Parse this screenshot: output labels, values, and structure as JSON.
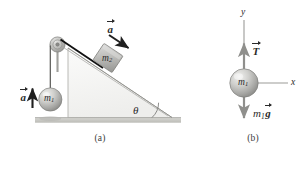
{
  "figure": {
    "panels": [
      {
        "id": "a",
        "caption": "(a)",
        "description": "Hanging mass m1 connected over a pulley to block m2 on a frictionless inclined plane",
        "labels": {
          "accel_hanging": "a",
          "accel_block": "a",
          "mass_hanging": "m",
          "mass_hanging_sub": "1",
          "mass_block": "m",
          "mass_block_sub": "2",
          "angle": "θ"
        }
      },
      {
        "id": "b",
        "caption": "(b)",
        "description": "Free-body diagram of the hanging mass m1 showing tension T upward and weight m1g downward",
        "labels": {
          "axis_y": "y",
          "axis_x": "x",
          "tension": "T",
          "mass": "m",
          "mass_sub": "1",
          "weight_mass": "m",
          "weight_sub": "1",
          "weight_g": "g"
        }
      }
    ]
  },
  "colors": {
    "ink": "#2a2a2a",
    "caption": "#3b3b3b",
    "incline_fill": "#f2f2f0",
    "incline_edge": "#9a9a9a",
    "ground": "#c9c9c4",
    "ground_edge": "#a8a8a2",
    "sphere_light": "#e8e8e6",
    "sphere_mid": "#b5b5b2",
    "sphere_dark": "#8d8d8a",
    "block_light": "#d8d8d6",
    "block_dark": "#9e9e9b",
    "pulley": "#bdbdba",
    "axis_gray": "#9b9b98",
    "arrow_black": "#1f1f1f",
    "background": "#ffffff"
  }
}
